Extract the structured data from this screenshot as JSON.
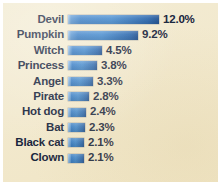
{
  "figure": {
    "panel_background": "#f2e9ce",
    "page_background": "#ffffff",
    "bar_color": "#2f78c4",
    "text_color": "#17243c"
  },
  "chart_data": {
    "type": "bar",
    "orientation": "horizontal",
    "title": "",
    "subtitle": "",
    "xlabel": "",
    "ylabel": "",
    "grid": false,
    "legend": null,
    "xlim": [
      0,
      12.0
    ],
    "value_suffix": "%",
    "categories": [
      "Devil",
      "Pumpkin",
      "Witch",
      "Princess",
      "Angel",
      "Pirate",
      "Hot dog",
      "Bat",
      "Black cat",
      "Clown"
    ],
    "values": [
      12.0,
      9.2,
      4.5,
      3.8,
      3.3,
      2.8,
      2.4,
      2.3,
      2.1,
      2.1
    ],
    "value_labels": [
      "12.0%",
      "9.2%",
      "4.5%",
      "3.8%",
      "3.3%",
      "2.8%",
      "2.4%",
      "2.3%",
      "2.1%",
      "2.1%"
    ],
    "rows": [
      {
        "label": "Devil",
        "value": 12.0,
        "value_label": "12.0%",
        "bar_px": 91
      },
      {
        "label": "Pumpkin",
        "value": 9.2,
        "value_label": "9.2%",
        "bar_px": 70
      },
      {
        "label": "Witch",
        "value": 4.5,
        "value_label": "4.5%",
        "bar_px": 34
      },
      {
        "label": "Princess",
        "value": 3.8,
        "value_label": "3.8%",
        "bar_px": 29
      },
      {
        "label": "Angel",
        "value": 3.3,
        "value_label": "3.3%",
        "bar_px": 25
      },
      {
        "label": "Pirate",
        "value": 2.8,
        "value_label": "2.8%",
        "bar_px": 21
      },
      {
        "label": "Hot dog",
        "value": 2.4,
        "value_label": "2.4%",
        "bar_px": 18
      },
      {
        "label": "Bat",
        "value": 2.3,
        "value_label": "2.3%",
        "bar_px": 17
      },
      {
        "label": "Black cat",
        "value": 2.1,
        "value_label": "2.1%",
        "bar_px": 16
      },
      {
        "label": "Clown",
        "value": 2.1,
        "value_label": "2.1%",
        "bar_px": 16
      }
    ]
  }
}
